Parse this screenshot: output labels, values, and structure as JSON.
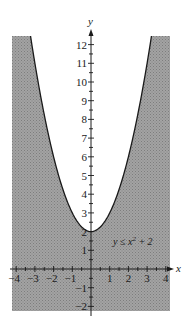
{
  "chart_data": {
    "type": "area",
    "title": "",
    "xlabel": "x",
    "ylabel": "y",
    "xlim": [
      -4.3,
      4.3
    ],
    "ylim": [
      -2.2,
      12.5
    ],
    "x_ticks": [
      -4,
      -3,
      -2,
      -1,
      1,
      2,
      3,
      4
    ],
    "y_ticks": [
      -2,
      -1,
      1,
      2,
      3,
      4,
      5,
      6,
      7,
      8,
      9,
      10,
      11,
      12
    ],
    "x_tick_labels": [
      "−4",
      "−3",
      "−2",
      "−1",
      "1",
      "2",
      "3",
      "4"
    ],
    "y_tick_labels": [
      "−2",
      "−1",
      "1",
      "2",
      "3",
      "4",
      "5",
      "6",
      "7",
      "8",
      "9",
      "10",
      "11",
      "12"
    ],
    "minor_ticks_per_unit": 2,
    "grid": false,
    "boundary": {
      "equation": "y = x^2 + 2",
      "style": "solid",
      "vertex": [
        0,
        2
      ]
    },
    "shaded_region": "below boundary (y <= x^2 + 2)",
    "annotations": [
      {
        "text": "y ≤ x² + 2",
        "x": 2.3,
        "y": 1.7
      }
    ],
    "colors": {
      "shade": "#9a9a9a",
      "curve": "#1a1a1a",
      "axes": "#1a1a1a",
      "background": "#ffffff"
    }
  },
  "labels": {
    "x_axis": "x",
    "y_axis": "y",
    "inequality_prefix": "y ≤ x",
    "inequality_exp": "2",
    "inequality_suffix": " + 2"
  }
}
